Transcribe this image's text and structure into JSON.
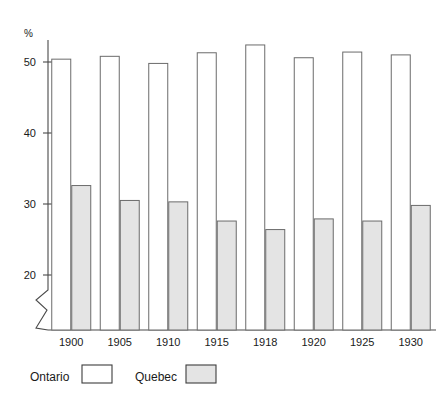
{
  "chart_data": {
    "type": "bar",
    "title": "",
    "subtitle": "",
    "xlabel": "",
    "ylabel": "%",
    "ylim": [
      15,
      53.5
    ],
    "axis_break": true,
    "grid": false,
    "legend_position": "bottom-left",
    "categories": [
      "1900",
      "1905",
      "1910",
      "1915",
      "1918",
      "1920",
      "1925",
      "1930"
    ],
    "series": [
      {
        "name": "Ontario",
        "values": [
          50.4,
          50.8,
          49.8,
          51.3,
          52.4,
          50.6,
          51.4,
          51.0
        ],
        "fill": "#ffffff",
        "stroke": "#6b6b6b"
      },
      {
        "name": "Quebec",
        "values": [
          32.6,
          30.5,
          30.3,
          27.6,
          26.4,
          27.9,
          27.6,
          29.8
        ],
        "fill": "#e4e4e4",
        "stroke": "#6b6b6b"
      }
    ],
    "y_ticks": [
      20,
      30,
      40,
      50
    ],
    "y_tick_labels": [
      "20",
      "30",
      "40",
      "50"
    ]
  },
  "axis": {
    "unit_label": "%"
  },
  "legend": {
    "items": [
      {
        "label": "Ontario",
        "swatch": "white-swatch-icon"
      },
      {
        "label": "Quebec",
        "swatch": "gray-swatch-icon"
      }
    ]
  }
}
